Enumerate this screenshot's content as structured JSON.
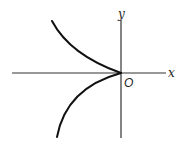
{
  "diagram": {
    "type": "cusp curve on coordinate axes",
    "axes": {
      "x_label": "x",
      "y_label": "y",
      "origin_label": "O"
    },
    "curves": [
      {
        "name": "upper-branch",
        "description": "curve descending from upper-left into origin"
      },
      {
        "name": "lower-branch",
        "description": "curve ascending from lower-left into origin"
      }
    ],
    "colors": {
      "axis": "#333333",
      "curve": "#111111",
      "background": "#ffffff"
    }
  }
}
